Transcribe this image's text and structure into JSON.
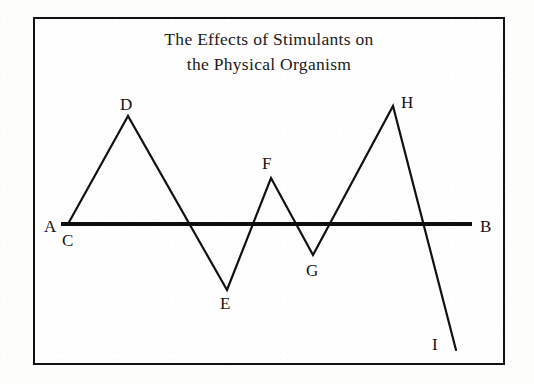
{
  "figure": {
    "title_line1": "The Effects of Stimulants on",
    "title_line2": "the Physical Organism",
    "border_color": "#111111",
    "line_color": "#101010",
    "background_color": "#fefefe"
  },
  "labels": {
    "a": "A",
    "b": "B",
    "c": "C",
    "d": "D",
    "e": "E",
    "f": "F",
    "g": "G",
    "h": "H",
    "i": "I"
  },
  "chart_data": {
    "type": "line",
    "title": "The Effects of Stimulants on the Physical Organism",
    "xlabel": "",
    "ylabel": "",
    "grid": false,
    "legend": null,
    "axis_ranges": {
      "x": [
        0,
        472
      ],
      "y": [
        -160,
        140
      ]
    },
    "baseline": {
      "name": "AB",
      "label_left": "A",
      "label_right": "B",
      "y_value": 0,
      "x_start": 61,
      "x_end": 472,
      "stroke_width": 4,
      "description": "Thick horizontal reference line labelled A at the left end and B at the right end"
    },
    "series": [
      {
        "name": "Stimulant effect curve",
        "stroke_width": 2.2,
        "points": [
          {
            "label": "C",
            "x": 68,
            "y": 0,
            "px": 68,
            "py": 224,
            "label_pos": "below"
          },
          {
            "label": "D",
            "x": 128,
            "y": 108,
            "px": 128,
            "py": 116,
            "label_pos": "above"
          },
          {
            "label": "E",
            "x": 227,
            "y": -66,
            "px": 227,
            "py": 290,
            "label_pos": "below"
          },
          {
            "label": "F",
            "x": 271,
            "y": 46,
            "px": 271,
            "py": 178,
            "label_pos": "above"
          },
          {
            "label": "G",
            "x": 313,
            "y": -31,
            "px": 313,
            "py": 255,
            "label_pos": "below"
          },
          {
            "label": "H",
            "x": 393,
            "y": 118,
            "px": 393,
            "py": 106,
            "label_pos": "above-right"
          },
          {
            "label": "I",
            "x": 456,
            "y": -126,
            "px": 456,
            "py": 350,
            "label_pos": "left"
          }
        ]
      }
    ],
    "annotations": [
      {
        "text": "A",
        "px": 44,
        "py": 218,
        "note": "left terminus label of baseline"
      },
      {
        "text": "B",
        "px": 480,
        "py": 218,
        "note": "right terminus label of baseline"
      },
      {
        "text": "C",
        "px": 62,
        "py": 232,
        "note": "curve start on baseline"
      },
      {
        "text": "D",
        "px": 120,
        "py": 96,
        "note": "first peak"
      },
      {
        "text": "E",
        "px": 220,
        "py": 295,
        "note": "deepest early trough"
      },
      {
        "text": "F",
        "px": 262,
        "py": 155,
        "note": "second, lower peak"
      },
      {
        "text": "G",
        "px": 306,
        "py": 262,
        "note": "shallow trough"
      },
      {
        "text": "H",
        "px": 401,
        "py": 94,
        "note": "highest peak"
      },
      {
        "text": "I",
        "px": 432,
        "py": 336,
        "note": "final descent endpoint"
      }
    ]
  }
}
